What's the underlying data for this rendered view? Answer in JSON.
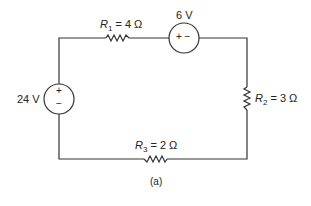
{
  "diagram": {
    "caption": "(a)",
    "source_left": {
      "value": "24 V",
      "plus": "+",
      "minus": "−"
    },
    "source_top": {
      "value": "6 V",
      "polarity": "+ −"
    },
    "r1": {
      "name": "R",
      "sub": "1",
      "value": "= 4 Ω"
    },
    "r2": {
      "name": "R",
      "sub": "2",
      "value": "= 3 Ω"
    },
    "r3": {
      "name": "R",
      "sub": "3",
      "value": "= 2 Ω"
    }
  }
}
